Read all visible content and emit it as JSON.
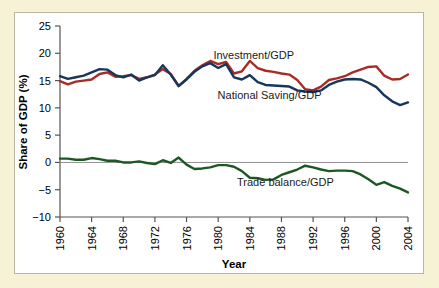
{
  "figure": {
    "background_color": "#f7f2d5",
    "panel_color": "#ffffff",
    "panel_border_color": "#b9b6a5"
  },
  "chart_data": {
    "type": "line",
    "title": "",
    "xlabel": "Year",
    "ylabel": "Share of GDP (%)",
    "xlim": [
      1960,
      2004
    ],
    "ylim": [
      -10,
      25
    ],
    "grid": false,
    "legend_position": "inline-annotations",
    "xticks": [
      1960,
      1964,
      1968,
      1972,
      1976,
      1980,
      1984,
      1988,
      1992,
      1996,
      2000,
      2004
    ],
    "xtick_labels": [
      "1960",
      "1964",
      "1968",
      "1972",
      "1976",
      "1980",
      "1984",
      "1988",
      "1992",
      "1996",
      "2000",
      "2004"
    ],
    "yticks": [
      -10,
      -5,
      0,
      5,
      10,
      15,
      20,
      25
    ],
    "ytick_labels": [
      "−10",
      "−5",
      "0",
      "5",
      "10",
      "15",
      "20",
      "25"
    ],
    "zero_line": 0,
    "x": [
      1960,
      1961,
      1962,
      1963,
      1964,
      1965,
      1966,
      1967,
      1968,
      1969,
      1970,
      1971,
      1972,
      1973,
      1974,
      1975,
      1976,
      1977,
      1978,
      1979,
      1980,
      1981,
      1982,
      1983,
      1984,
      1985,
      1986,
      1987,
      1988,
      1989,
      1990,
      1991,
      1992,
      1993,
      1994,
      1995,
      1996,
      1997,
      1998,
      1999,
      2000,
      2001,
      2002,
      2003,
      2004
    ],
    "series": [
      {
        "name": "Investment/GDP",
        "color": "#a82c23",
        "label_x": 1984.5,
        "label_y": 19.0,
        "values": [
          14.9,
          14.3,
          14.8,
          15.0,
          15.2,
          16.2,
          16.5,
          15.7,
          15.8,
          16.0,
          15.3,
          15.6,
          16.1,
          17.1,
          16.2,
          14.0,
          15.3,
          16.8,
          17.8,
          18.6,
          18.0,
          18.4,
          16.3,
          16.7,
          18.6,
          17.3,
          16.8,
          16.6,
          16.3,
          16.1,
          15.1,
          13.4,
          13.2,
          13.9,
          15.1,
          15.4,
          15.8,
          16.5,
          17.0,
          17.5,
          17.6,
          15.9,
          15.2,
          15.3,
          16.1
        ]
      },
      {
        "name": "National Saving/GDP",
        "color": "#17365d",
        "label_x": 1986.5,
        "label_y": 11.6,
        "values": [
          15.8,
          15.3,
          15.6,
          15.9,
          16.5,
          17.1,
          17.0,
          16.0,
          15.6,
          16.1,
          15.0,
          15.6,
          16.0,
          17.8,
          16.1,
          14.0,
          15.2,
          16.6,
          17.6,
          18.2,
          17.3,
          18.0,
          15.6,
          15.2,
          16.0,
          14.7,
          14.2,
          14.1,
          14.0,
          13.9,
          13.2,
          13.0,
          12.9,
          13.2,
          14.2,
          14.8,
          15.2,
          15.3,
          15.2,
          14.6,
          13.8,
          12.3,
          11.2,
          10.5,
          11.0
        ]
      },
      {
        "name": "Trade balance/GDP",
        "color": "#1d5723",
        "label_x": 1988.5,
        "label_y": -4.4,
        "values": [
          0.7,
          0.7,
          0.5,
          0.5,
          0.8,
          0.6,
          0.3,
          0.3,
          0.0,
          0.0,
          0.2,
          -0.1,
          -0.3,
          0.4,
          -0.1,
          0.9,
          -0.4,
          -1.2,
          -1.1,
          -0.9,
          -0.5,
          -0.5,
          -0.8,
          -1.6,
          -2.8,
          -2.9,
          -3.2,
          -3.1,
          -2.3,
          -1.8,
          -1.3,
          -0.6,
          -0.9,
          -1.3,
          -1.6,
          -1.5,
          -1.5,
          -1.6,
          -2.2,
          -3.1,
          -4.1,
          -3.6,
          -4.3,
          -4.8,
          -5.5
        ]
      }
    ]
  }
}
